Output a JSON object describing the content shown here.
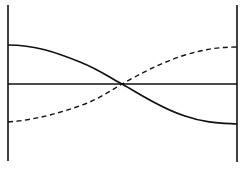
{
  "diagram": {
    "type": "waveform-crossing",
    "colors": {
      "background": "#ffffff",
      "stroke": "#111111"
    },
    "boundaries": {
      "left": {
        "x": 8,
        "y1": 5,
        "y2": 161
      },
      "right": {
        "x": 237,
        "y1": 5,
        "y2": 162
      }
    },
    "axis": {
      "y": 84,
      "x1": 8,
      "x2": 237
    },
    "crossing_point": {
      "x": 122,
      "y": 84
    },
    "curves": [
      {
        "name": "solid",
        "style": "solid",
        "start": {
          "x": 8,
          "y": 45
        },
        "end": {
          "x": 237,
          "y": 124
        },
        "path": "M8,45 C35,45 55,52 80,62 C100,70 110,78 122,84 C140,94 160,108 185,116 C205,123 220,123 237,124"
      },
      {
        "name": "dashed",
        "style": "dashed",
        "start": {
          "x": 8,
          "y": 122
        },
        "end": {
          "x": 237,
          "y": 47
        },
        "path": "M8,122 C35,120 60,113 85,104 C100,98 112,90 122,84 C140,74 160,63 185,55 C205,49 220,47 237,47"
      }
    ]
  }
}
